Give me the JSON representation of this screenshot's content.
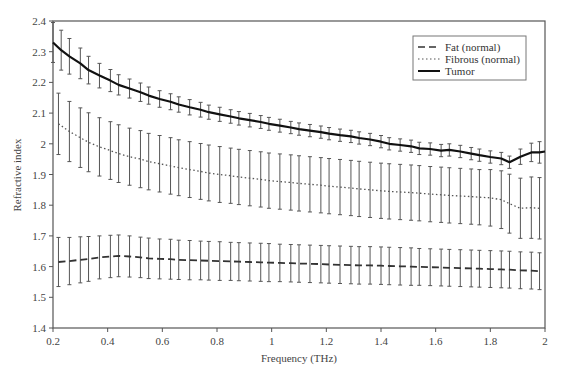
{
  "chart_data": {
    "type": "line",
    "title": "",
    "xlabel": "Frequency (THz)",
    "ylabel": "Refractive index",
    "xlim": [
      0.2,
      2.0
    ],
    "ylim": [
      1.4,
      2.4
    ],
    "x_ticks": [
      "0.2",
      "0.4",
      "0.6",
      "0.8",
      "1",
      "1.2",
      "1.4",
      "1.6",
      "1.8",
      "2"
    ],
    "y_ticks": [
      "1.4",
      "1.5",
      "1.6",
      "1.7",
      "1.8",
      "1.9",
      "2",
      "2.1",
      "2.2",
      "2.3",
      "2.4"
    ],
    "grid": false,
    "legend_position": "upper right",
    "error_bars": true,
    "series": [
      {
        "name": "Fat (normal)",
        "line_style": "dashed",
        "color": "#333333",
        "x": [
          0.22,
          0.26,
          0.3,
          0.33,
          0.37,
          0.41,
          0.44,
          0.48,
          0.52,
          0.55,
          0.59,
          0.63,
          0.66,
          0.7,
          0.74,
          0.77,
          0.81,
          0.85,
          0.88,
          0.92,
          0.96,
          0.99,
          1.03,
          1.07,
          1.1,
          1.14,
          1.18,
          1.21,
          1.25,
          1.29,
          1.32,
          1.36,
          1.4,
          1.43,
          1.47,
          1.51,
          1.54,
          1.58,
          1.62,
          1.65,
          1.69,
          1.73,
          1.76,
          1.8,
          1.84,
          1.87,
          1.91,
          1.95,
          1.98
        ],
        "values": [
          1.615,
          1.618,
          1.622,
          1.625,
          1.63,
          1.633,
          1.635,
          1.633,
          1.63,
          1.627,
          1.625,
          1.624,
          1.622,
          1.621,
          1.62,
          1.619,
          1.618,
          1.617,
          1.616,
          1.615,
          1.614,
          1.613,
          1.612,
          1.611,
          1.61,
          1.609,
          1.608,
          1.607,
          1.606,
          1.605,
          1.604,
          1.604,
          1.603,
          1.602,
          1.601,
          1.6,
          1.599,
          1.598,
          1.597,
          1.596,
          1.595,
          1.594,
          1.593,
          1.592,
          1.591,
          1.59,
          1.588,
          1.587,
          1.585
        ],
        "errors": [
          0.08,
          0.077,
          0.075,
          0.073,
          0.07,
          0.069,
          0.068,
          0.067,
          0.066,
          0.066,
          0.065,
          0.065,
          0.064,
          0.064,
          0.063,
          0.063,
          0.063,
          0.062,
          0.062,
          0.062,
          0.062,
          0.062,
          0.061,
          0.061,
          0.061,
          0.061,
          0.061,
          0.061,
          0.061,
          0.061,
          0.061,
          0.061,
          0.061,
          0.061,
          0.061,
          0.061,
          0.06,
          0.06,
          0.06,
          0.06,
          0.06,
          0.06,
          0.06,
          0.06,
          0.06,
          0.06,
          0.06,
          0.06,
          0.06
        ]
      },
      {
        "name": "Fibrous (normal)",
        "line_style": "dotted",
        "color": "#555555",
        "x": [
          0.22,
          0.26,
          0.3,
          0.33,
          0.37,
          0.41,
          0.44,
          0.48,
          0.52,
          0.55,
          0.59,
          0.63,
          0.66,
          0.7,
          0.74,
          0.77,
          0.81,
          0.85,
          0.88,
          0.92,
          0.96,
          0.99,
          1.03,
          1.07,
          1.1,
          1.14,
          1.18,
          1.21,
          1.25,
          1.29,
          1.32,
          1.36,
          1.4,
          1.43,
          1.47,
          1.51,
          1.54,
          1.58,
          1.62,
          1.65,
          1.69,
          1.73,
          1.76,
          1.8,
          1.84,
          1.87,
          1.91,
          1.95,
          1.98
        ],
        "values": [
          2.065,
          2.04,
          2.02,
          2.005,
          1.99,
          1.978,
          1.968,
          1.958,
          1.95,
          1.942,
          1.935,
          1.928,
          1.922,
          1.916,
          1.91,
          1.905,
          1.9,
          1.896,
          1.892,
          1.888,
          1.884,
          1.88,
          1.877,
          1.874,
          1.871,
          1.868,
          1.865,
          1.862,
          1.859,
          1.856,
          1.853,
          1.85,
          1.847,
          1.845,
          1.843,
          1.841,
          1.839,
          1.836,
          1.834,
          1.832,
          1.83,
          1.828,
          1.826,
          1.824,
          1.818,
          1.805,
          1.79,
          1.792,
          1.79
        ],
        "errors": [
          0.1,
          0.098,
          0.097,
          0.096,
          0.095,
          0.094,
          0.094,
          0.093,
          0.093,
          0.092,
          0.092,
          0.092,
          0.091,
          0.091,
          0.091,
          0.091,
          0.091,
          0.09,
          0.09,
          0.09,
          0.09,
          0.09,
          0.09,
          0.09,
          0.09,
          0.09,
          0.09,
          0.09,
          0.09,
          0.09,
          0.09,
          0.09,
          0.09,
          0.09,
          0.09,
          0.09,
          0.09,
          0.09,
          0.09,
          0.09,
          0.09,
          0.09,
          0.09,
          0.092,
          0.094,
          0.096,
          0.098,
          0.1,
          0.1
        ]
      },
      {
        "name": "Tumor",
        "line_style": "solid",
        "color": "#111111",
        "x": [
          0.2,
          0.23,
          0.26,
          0.3,
          0.33,
          0.37,
          0.41,
          0.44,
          0.48,
          0.52,
          0.55,
          0.59,
          0.63,
          0.66,
          0.7,
          0.74,
          0.77,
          0.81,
          0.85,
          0.88,
          0.92,
          0.96,
          0.99,
          1.03,
          1.07,
          1.1,
          1.14,
          1.18,
          1.21,
          1.25,
          1.29,
          1.32,
          1.36,
          1.4,
          1.43,
          1.47,
          1.51,
          1.54,
          1.58,
          1.62,
          1.65,
          1.69,
          1.73,
          1.76,
          1.8,
          1.84,
          1.87,
          1.91,
          1.95,
          1.98,
          2.0
        ],
        "values": [
          2.33,
          2.305,
          2.285,
          2.262,
          2.24,
          2.222,
          2.206,
          2.192,
          2.18,
          2.168,
          2.157,
          2.146,
          2.137,
          2.128,
          2.119,
          2.111,
          2.103,
          2.096,
          2.089,
          2.083,
          2.077,
          2.071,
          2.065,
          2.059,
          2.053,
          2.048,
          2.043,
          2.038,
          2.033,
          2.028,
          2.024,
          2.019,
          2.014,
          2.007,
          2.0,
          1.996,
          1.992,
          1.985,
          1.983,
          1.978,
          1.98,
          1.975,
          1.968,
          1.963,
          1.957,
          1.952,
          1.94,
          1.958,
          1.972,
          1.972,
          1.975
        ],
        "errors": [
          0.065,
          0.065,
          0.058,
          0.05,
          0.045,
          0.04,
          0.036,
          0.033,
          0.031,
          0.03,
          0.028,
          0.027,
          0.026,
          0.025,
          0.025,
          0.024,
          0.023,
          0.023,
          0.022,
          0.022,
          0.022,
          0.021,
          0.021,
          0.021,
          0.02,
          0.02,
          0.02,
          0.02,
          0.02,
          0.02,
          0.02,
          0.02,
          0.02,
          0.02,
          0.02,
          0.02,
          0.02,
          0.02,
          0.02,
          0.02,
          0.02,
          0.02,
          0.02,
          0.02,
          0.02,
          0.02,
          0.02,
          0.025,
          0.03,
          0.035,
          0.0
        ]
      }
    ]
  },
  "legend": {
    "items": [
      {
        "label": "Fat (normal)",
        "style": "dashed"
      },
      {
        "label": "Fibrous (normal)",
        "style": "dotted"
      },
      {
        "label": "Tumor",
        "style": "solid"
      }
    ]
  },
  "axes": {
    "xlabel": "Frequency (THz)",
    "ylabel": "Refractive index"
  },
  "colors": {
    "axis": "#555555",
    "errorbar": "#555555",
    "text": "#444444"
  }
}
